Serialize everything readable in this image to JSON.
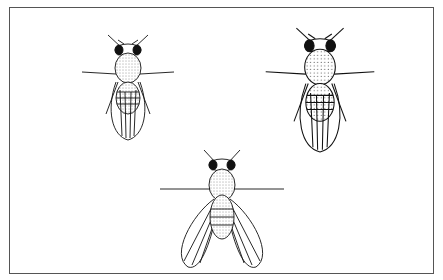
{
  "figure": {
    "flies": [
      {
        "id": "fly-top-left",
        "pose": "wings folded",
        "cx": 128,
        "cy": 90
      },
      {
        "id": "fly-top-right",
        "pose": "wings folded, larger",
        "cx": 320,
        "cy": 95
      },
      {
        "id": "fly-bottom-center",
        "pose": "wings spread",
        "cx": 222,
        "cy": 205
      }
    ],
    "colors": {
      "ink": "#111111",
      "paper": "#ffffff",
      "border": "#555555"
    }
  }
}
